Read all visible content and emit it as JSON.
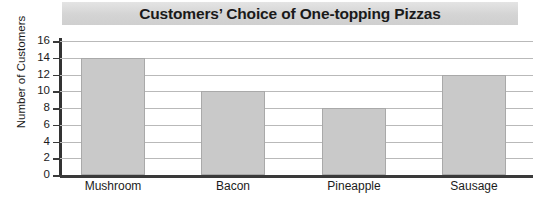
{
  "chart_data": {
    "type": "bar",
    "title": "Customers’ Choice of One-topping Pizzas",
    "xlabel": "",
    "ylabel": "Number of Customers",
    "categories": [
      "Mushroom",
      "Bacon",
      "Pineapple",
      "Sausage"
    ],
    "values": [
      14,
      10,
      8,
      12
    ],
    "ylim": [
      0,
      16
    ],
    "ytick_labels": [
      "16",
      "14",
      "12",
      "10",
      "8",
      "6",
      "4",
      "2",
      "0"
    ],
    "ytick_values": [
      16,
      14,
      12,
      10,
      8,
      6,
      4,
      2,
      0
    ],
    "grid": true,
    "legend": null,
    "series": [
      {
        "name": "Number of Customers",
        "values": [
          14,
          10,
          8,
          12
        ]
      }
    ],
    "colors": {
      "bar_fill": "#c9c9c9",
      "bar_border": "#a9a9a9",
      "gridline": "#b9b9b9",
      "axis": "#333333",
      "title_banner": "#d4d4d4",
      "text": "#1b1b1b",
      "background": "#ffffff"
    }
  }
}
